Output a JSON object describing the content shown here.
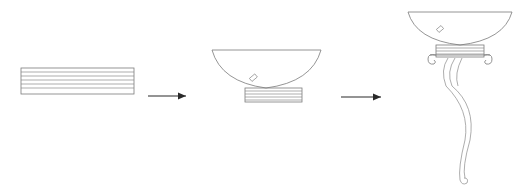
{
  "diagram": {
    "type": "process-sequence",
    "stages": [
      {
        "id": "stage-1",
        "name": "stacked-plates",
        "stripe_count": 6
      },
      {
        "id": "stage-2",
        "name": "bowl-on-plates",
        "stripe_count": 6
      },
      {
        "id": "stage-3",
        "name": "bowl-with-bracket-and-stem",
        "stripe_count": 6
      }
    ],
    "arrows": [
      {
        "from": "stage-1",
        "to": "stage-2"
      },
      {
        "from": "stage-2",
        "to": "stage-3"
      }
    ],
    "colors": {
      "line": "#7a7a7a",
      "arrow": "#2a2a2a",
      "background": "#ffffff"
    }
  }
}
